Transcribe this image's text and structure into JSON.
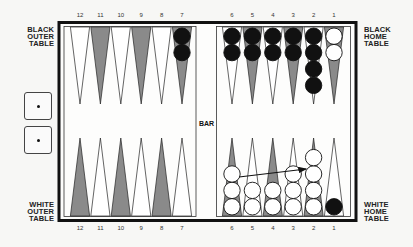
{
  "labels": {
    "black_outer": [
      "BLACK",
      "OUTER",
      "TABLE"
    ],
    "black_home": [
      "BLACK",
      "HOME",
      "TABLE"
    ],
    "white_outer": [
      "WHITE",
      "OUTER",
      "TABLE"
    ],
    "white_home": [
      "WHITE",
      "HOME",
      "TABLE"
    ],
    "bar": "BAR"
  },
  "point_numbers": {
    "top_left": [
      "12",
      "11",
      "10",
      "9",
      "8",
      "7"
    ],
    "top_right": [
      "6",
      "5",
      "4",
      "3",
      "2",
      "1"
    ],
    "bottom_left": [
      "12",
      "11",
      "10",
      "9",
      "8",
      "7"
    ],
    "bottom_right": [
      "6",
      "5",
      "4",
      "3",
      "2",
      "1"
    ]
  },
  "dice": [
    {
      "value": 1
    },
    {
      "value": 1
    }
  ],
  "colors": {
    "frame": "#111111",
    "dark_point": "#8a8a8a",
    "light_point": "#ffffff",
    "black_checker": "#111111",
    "white_checker": "#ffffff",
    "background": "#f7f7f5"
  },
  "board": {
    "top_left": [
      {
        "point": 12,
        "shade": "light",
        "checkers": []
      },
      {
        "point": 11,
        "shade": "dark",
        "checkers": []
      },
      {
        "point": 10,
        "shade": "light",
        "checkers": []
      },
      {
        "point": 9,
        "shade": "dark",
        "checkers": []
      },
      {
        "point": 8,
        "shade": "light",
        "checkers": []
      },
      {
        "point": 7,
        "shade": "dark",
        "checkers": [
          "black",
          "black"
        ]
      }
    ],
    "top_right": [
      {
        "point": 6,
        "shade": "light",
        "checkers": [
          "black",
          "black"
        ]
      },
      {
        "point": 5,
        "shade": "dark",
        "checkers": [
          "black",
          "black"
        ]
      },
      {
        "point": 4,
        "shade": "light",
        "checkers": [
          "black",
          "black"
        ]
      },
      {
        "point": 3,
        "shade": "dark",
        "checkers": [
          "black",
          "black"
        ]
      },
      {
        "point": 2,
        "shade": "light",
        "checkers": [
          "black",
          "black",
          "black",
          "black"
        ]
      },
      {
        "point": 1,
        "shade": "dark",
        "checkers": [
          "white",
          "white"
        ]
      }
    ],
    "bottom_left": [
      {
        "point": 12,
        "shade": "dark",
        "checkers": []
      },
      {
        "point": 11,
        "shade": "light",
        "checkers": []
      },
      {
        "point": 10,
        "shade": "dark",
        "checkers": []
      },
      {
        "point": 9,
        "shade": "light",
        "checkers": []
      },
      {
        "point": 8,
        "shade": "dark",
        "checkers": []
      },
      {
        "point": 7,
        "shade": "light",
        "checkers": []
      }
    ],
    "bottom_right": [
      {
        "point": 6,
        "shade": "dark",
        "checkers": [
          "white",
          "white",
          "white"
        ]
      },
      {
        "point": 5,
        "shade": "light",
        "checkers": [
          "white",
          "white"
        ]
      },
      {
        "point": 4,
        "shade": "dark",
        "checkers": [
          "white",
          "white"
        ]
      },
      {
        "point": 3,
        "shade": "light",
        "checkers": [
          "white",
          "white",
          "white"
        ]
      },
      {
        "point": 2,
        "shade": "dark",
        "checkers": [
          "white",
          "white",
          "white",
          "white"
        ]
      },
      {
        "point": 1,
        "shade": "light",
        "checkers": [
          "black"
        ]
      }
    ]
  },
  "move_arrow": {
    "from_point": 6,
    "to_point": 2,
    "side": "white_home"
  }
}
